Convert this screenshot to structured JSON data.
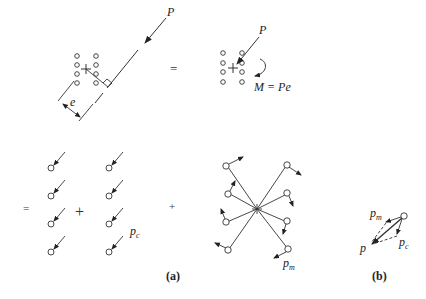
{
  "diagram": {
    "top_left": {
      "force_label": "P",
      "eccentricity_label": "e"
    },
    "equals_top": "=",
    "top_right": {
      "force_label": "P",
      "moment_label": "M = Pe"
    },
    "equals_bottom": "=",
    "plus_1": "+",
    "plus_2": "+",
    "direct_shear_label": "p",
    "direct_shear_sub": "c",
    "moment_shear_label": "p",
    "moment_shear_sub": "m",
    "resultant": {
      "pm_label": "p",
      "pm_sub": "m",
      "pc_label": "p",
      "pc_sub": "c",
      "p_label": "p"
    },
    "caption_a": "(a)",
    "caption_b": "(b)"
  }
}
